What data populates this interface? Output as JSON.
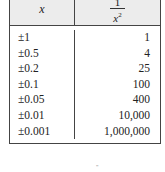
{
  "table": {
    "headers": {
      "col1": "x",
      "col2_numerator": "1",
      "col2_denominator": "x",
      "col2_exponent": "2"
    },
    "rows": [
      {
        "x": "±1",
        "value": "1"
      },
      {
        "x": "±0.5",
        "value": "4"
      },
      {
        "x": "±0.2",
        "value": "25"
      },
      {
        "x": "±0.1",
        "value": "100"
      },
      {
        "x": "±0.05",
        "value": "400"
      },
      {
        "x": "±0.01",
        "value": "10,000"
      },
      {
        "x": "±0.001",
        "value": "1,000,000"
      }
    ]
  },
  "footer_mark": "\""
}
